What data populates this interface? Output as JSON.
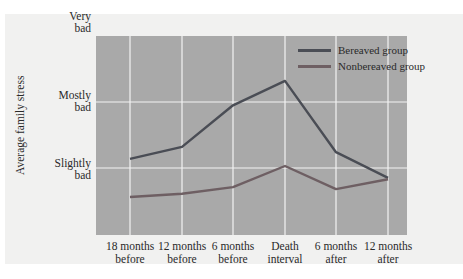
{
  "chart_data": {
    "type": "line",
    "title": "",
    "xlabel": "",
    "ylabel": "Average family stress",
    "categories": [
      "18 months before",
      "12 months before",
      "6 months before",
      "Death interval",
      "6 months after",
      "12 months after"
    ],
    "y_ticks": [
      {
        "label": "Slightly bad",
        "value": 2
      },
      {
        "label": "Mostly bad",
        "value": 3
      },
      {
        "label": "Very bad",
        "value": 4
      }
    ],
    "ylim": [
      1,
      4
    ],
    "grid": true,
    "legend_position": "upper right",
    "series": [
      {
        "name": "Bereaved group",
        "color": "#4a4d55",
        "values": [
          2.14,
          2.32,
          2.95,
          3.32,
          2.24,
          1.85
        ]
      },
      {
        "name": "Nonbereaved group",
        "color": "#6e5f63",
        "values": [
          1.56,
          1.61,
          1.71,
          2.03,
          1.68,
          1.83
        ]
      }
    ]
  },
  "axis": {
    "y_title": "Average family stress",
    "y_labels": [
      {
        "line1": "Very",
        "line2": "bad"
      },
      {
        "line1": "Mostly",
        "line2": "bad"
      },
      {
        "line1": "Slightly",
        "line2": "bad"
      }
    ],
    "x_labels": [
      {
        "line1": "18 months",
        "line2": "before"
      },
      {
        "line1": "12 months",
        "line2": "before"
      },
      {
        "line1": "6 months",
        "line2": "before"
      },
      {
        "line1": "Death",
        "line2": "interval"
      },
      {
        "line1": "6 months",
        "line2": "after"
      },
      {
        "line1": "12 months",
        "line2": "after"
      }
    ]
  },
  "legend": {
    "items": [
      {
        "label": "Bereaved group",
        "color": "#4a4d55"
      },
      {
        "label": "Nonbereaved group",
        "color": "#6e5f63"
      }
    ]
  },
  "colors": {
    "plot_background": "#a9a9a9",
    "gridline": "#f4f4f4",
    "card_background": "#f1f1f0"
  }
}
